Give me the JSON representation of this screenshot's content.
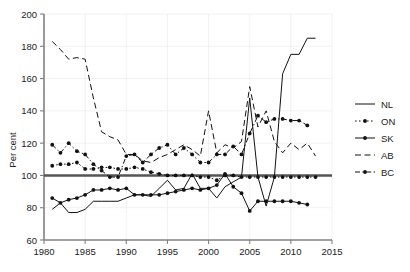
{
  "chart_data": {
    "type": "line",
    "title": "",
    "xlabel": "",
    "ylabel": "Per cent",
    "xlim": [
      1980,
      2015
    ],
    "ylim": [
      60,
      200
    ],
    "xticks": [
      1980,
      1985,
      1990,
      1995,
      2000,
      2005,
      2010,
      2015
    ],
    "yticks": [
      60,
      80,
      100,
      120,
      140,
      160,
      180,
      200
    ],
    "grid": true,
    "legend_position": "right",
    "reference_line": {
      "value": 100,
      "orientation": "horizontal",
      "label": ""
    },
    "series": [
      {
        "name": "NL",
        "style": "solid",
        "markers": false,
        "x": [
          1981,
          1982,
          1983,
          1984,
          1985,
          1986,
          1987,
          1988,
          1989,
          1990,
          1991,
          1992,
          1993,
          1994,
          1995,
          1996,
          1997,
          1998,
          1999,
          2000,
          2001,
          2002,
          2003,
          2004,
          2005,
          2006,
          2007,
          2008,
          2009,
          2010,
          2011,
          2012,
          2013
        ],
        "values": [
          79,
          83,
          77,
          77,
          79,
          84,
          84,
          84,
          84,
          86,
          88,
          88,
          87,
          92,
          97,
          91,
          92,
          101,
          92,
          92,
          86,
          93,
          96,
          99,
          148,
          99,
          81,
          99,
          163,
          175,
          175,
          185,
          185
        ]
      },
      {
        "name": "ON",
        "style": "dotted",
        "markers": true,
        "x": [
          1981,
          1982,
          1983,
          1984,
          1985,
          1986,
          1987,
          1988,
          1989,
          1990,
          1991,
          1992,
          1993,
          1994,
          1995,
          1996,
          1997,
          1998,
          1999,
          2000,
          2001,
          2002,
          2003,
          2004,
          2005,
          2006,
          2007,
          2008,
          2009,
          2010,
          2011,
          2012,
          2013
        ],
        "values": [
          106,
          107,
          107,
          108,
          104,
          104,
          105,
          105,
          104,
          104,
          105,
          104,
          102,
          101,
          100,
          100,
          100,
          100,
          99,
          99,
          97,
          100,
          100,
          99,
          99,
          99,
          99,
          99,
          99,
          99,
          99,
          99,
          99
        ]
      },
      {
        "name": "SK",
        "style": "solid",
        "markers": true,
        "x": [
          1981,
          1982,
          1983,
          1984,
          1985,
          1986,
          1987,
          1988,
          1989,
          1990,
          1991,
          1992,
          1993,
          1994,
          1995,
          1996,
          1997,
          1998,
          1999,
          2000,
          2001,
          2002,
          2003,
          2004,
          2005,
          2006,
          2007,
          2008,
          2009,
          2010,
          2011,
          2012
        ],
        "values": [
          86,
          83,
          85,
          86,
          88,
          91,
          91,
          92,
          91,
          92,
          88,
          88,
          88,
          88,
          89,
          90,
          91,
          92,
          91,
          92,
          94,
          101,
          93,
          89,
          78,
          84,
          84,
          84,
          84,
          84,
          83,
          82
        ]
      },
      {
        "name": "AB",
        "style": "dashed",
        "markers": false,
        "x": [
          1981,
          1982,
          1983,
          1984,
          1985,
          1986,
          1987,
          1988,
          1989,
          1990,
          1991,
          1992,
          1993,
          1994,
          1995,
          1996,
          1997,
          1998,
          1999,
          2000,
          2001,
          2002,
          2003,
          2004,
          2005,
          2006,
          2007,
          2008,
          2009,
          2010,
          2011,
          2012,
          2013
        ],
        "values": [
          183,
          178,
          172,
          173,
          172,
          148,
          127,
          124,
          122,
          113,
          113,
          109,
          108,
          111,
          113,
          116,
          119,
          116,
          112,
          140,
          114,
          119,
          117,
          121,
          155,
          130,
          140,
          121,
          114,
          120,
          116,
          120,
          112
        ]
      },
      {
        "name": "BC",
        "style": "dashdot",
        "markers": true,
        "x": [
          1981,
          1982,
          1983,
          1984,
          1985,
          1986,
          1987,
          1988,
          1989,
          1990,
          1991,
          1992,
          1993,
          1994,
          1995,
          1996,
          1997,
          1998,
          1999,
          2000,
          2001,
          2002,
          2003,
          2004,
          2005,
          2006,
          2007,
          2008,
          2009,
          2010,
          2011,
          2012
        ],
        "values": [
          119,
          114,
          120,
          115,
          113,
          107,
          103,
          99,
          99,
          112,
          113,
          108,
          113,
          117,
          119,
          113,
          117,
          113,
          108,
          108,
          113,
          113,
          118,
          113,
          126,
          137,
          133,
          135,
          135,
          134,
          134,
          131
        ]
      }
    ]
  },
  "axes": {
    "ylabel": "Per cent",
    "xtick_labels": [
      "1980",
      "1985",
      "1990",
      "1995",
      "2000",
      "2005",
      "2010",
      "2015"
    ],
    "ytick_labels": [
      "60",
      "80",
      "100",
      "120",
      "140",
      "160",
      "180",
      "200"
    ]
  },
  "legend": {
    "entries": [
      {
        "label": "NL",
        "style": "solid",
        "marker": false
      },
      {
        "label": "ON",
        "style": "dotted",
        "marker": true
      },
      {
        "label": "SK",
        "style": "solid",
        "marker": true
      },
      {
        "label": "AB",
        "style": "dashed",
        "marker": false
      },
      {
        "label": "BC",
        "style": "dashdot",
        "marker": true
      }
    ]
  },
  "colors": {
    "line": "#111111",
    "grid": "#eeeeee",
    "axis": "#808080",
    "reference": "#555555",
    "background": "#ffffff"
  }
}
